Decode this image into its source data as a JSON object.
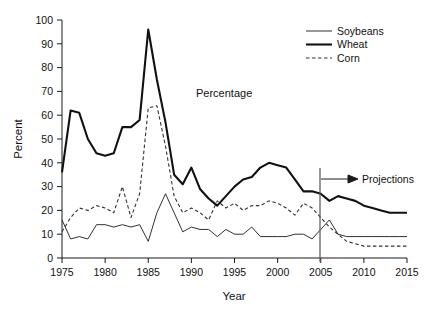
{
  "chart_data": {
    "type": "line",
    "title": "",
    "inner_label": "Percentage",
    "xlabel": "Year",
    "ylabel": "Percent",
    "xlim": [
      1975,
      2015
    ],
    "ylim": [
      0,
      100
    ],
    "xticks": [
      1975,
      1980,
      1985,
      1990,
      1995,
      2000,
      2005,
      2010,
      2015
    ],
    "yticks": [
      0,
      10,
      20,
      30,
      40,
      50,
      60,
      70,
      80,
      90,
      100
    ],
    "grid": false,
    "legend_position": "top-right",
    "annotation": {
      "label": "Projections",
      "divider_year": 2007,
      "arrow": "right"
    },
    "x": [
      1975,
      1976,
      1977,
      1978,
      1979,
      1980,
      1981,
      1982,
      1983,
      1984,
      1985,
      1986,
      1987,
      1988,
      1989,
      1990,
      1991,
      1992,
      1993,
      1994,
      1995,
      1996,
      1997,
      1998,
      1999,
      2000,
      2001,
      2002,
      2003,
      2004,
      2005,
      2006,
      2007,
      2008,
      2009,
      2010,
      2011,
      2012,
      2013,
      2014,
      2015
    ],
    "series": [
      {
        "name": "Soybeans",
        "style": "thin-solid",
        "color": "#1a1a1a",
        "values": [
          16,
          8,
          9,
          8,
          14,
          14,
          13,
          14,
          13,
          14,
          7,
          19,
          27,
          19,
          11,
          13,
          12,
          12,
          9,
          12,
          10,
          10,
          13,
          9,
          9,
          9,
          9,
          10,
          10,
          8,
          12,
          16,
          10,
          9,
          9,
          9,
          9,
          9,
          9,
          9,
          9
        ]
      },
      {
        "name": "Wheat",
        "style": "thick-solid",
        "color": "#111111",
        "values": [
          36,
          62,
          61,
          50,
          44,
          43,
          44,
          55,
          55,
          58,
          96,
          75,
          57,
          35,
          31,
          38,
          29,
          25,
          22,
          26,
          30,
          33,
          34,
          38,
          40,
          39,
          38,
          33,
          28,
          28,
          27,
          24,
          26,
          25,
          24,
          22,
          21,
          20,
          19,
          19,
          19
        ]
      },
      {
        "name": "Corn",
        "style": "dashed",
        "color": "#333333",
        "values": [
          11,
          17,
          21,
          20,
          22,
          21,
          19,
          30,
          17,
          27,
          63,
          64,
          47,
          26,
          19,
          21,
          19,
          16,
          24,
          21,
          23,
          20,
          22,
          22,
          24,
          23,
          21,
          18,
          23,
          21,
          17,
          13,
          10,
          7,
          6,
          5,
          5,
          5,
          5,
          5,
          5
        ]
      }
    ]
  },
  "axis": {
    "y_label": "Percent",
    "x_label": "Year"
  },
  "legend": {
    "items": [
      {
        "label": "Soybeans",
        "style": "thin-solid"
      },
      {
        "label": "Wheat",
        "style": "thick-solid"
      },
      {
        "label": "Corn",
        "style": "dashed"
      }
    ]
  }
}
